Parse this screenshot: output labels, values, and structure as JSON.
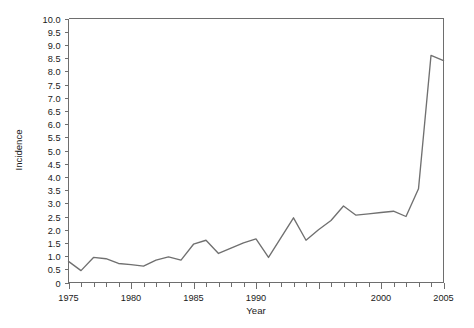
{
  "chart_data": {
    "type": "line",
    "title": "",
    "xlabel": "Year",
    "ylabel": "Incidence",
    "xlim": [
      1975,
      2005
    ],
    "ylim": [
      0,
      10
    ],
    "grid": false,
    "legend": null,
    "x_major_ticks": [
      1975,
      1980,
      1985,
      1990,
      1995,
      2000,
      2005
    ],
    "x_tick_labels": [
      "1975",
      "1980",
      "1985",
      "1990",
      "",
      "2000",
      "2005"
    ],
    "x_minor_tick_step": 1,
    "y_ticks": [
      0,
      0.5,
      1.0,
      1.5,
      2.0,
      2.5,
      3.0,
      3.5,
      4.0,
      4.5,
      5.0,
      5.5,
      6.0,
      6.5,
      7.0,
      7.5,
      8.0,
      8.5,
      9.0,
      9.5,
      10.0
    ],
    "y_tick_labels": [
      "0",
      "0.5",
      "1.0",
      "1.5",
      "2.0",
      "2.5",
      "3.0",
      "3.5",
      "4.0",
      "4.5",
      "5.0",
      "5.5",
      "6.0",
      "6.5",
      "7.0",
      "7.5",
      "8.0",
      "8.5",
      "9.0",
      "9.5",
      "10.0"
    ],
    "line_color": "#707070",
    "axis_color": "#6e6e6e",
    "x": [
      1975,
      1976,
      1977,
      1978,
      1979,
      1980,
      1981,
      1982,
      1983,
      1984,
      1985,
      1986,
      1987,
      1988,
      1989,
      1990,
      1991,
      1992,
      1993,
      1994,
      1995,
      1996,
      1997,
      1998,
      1999,
      2000,
      2001,
      2002,
      2003,
      2004,
      2005
    ],
    "values": [
      0.8,
      0.45,
      0.95,
      0.9,
      0.72,
      0.68,
      0.62,
      0.85,
      0.97,
      0.85,
      1.45,
      1.6,
      1.1,
      1.3,
      1.5,
      1.65,
      0.95,
      1.7,
      2.45,
      1.6,
      2.0,
      2.35,
      2.9,
      2.55,
      2.6,
      2.65,
      2.7,
      2.5,
      3.55,
      8.6,
      8.4
    ],
    "series": [
      {
        "name": "Incidence",
        "values": [
          0.8,
          0.45,
          0.95,
          0.9,
          0.72,
          0.68,
          0.62,
          0.85,
          0.97,
          0.85,
          1.45,
          1.6,
          1.1,
          1.3,
          1.5,
          1.65,
          0.95,
          1.7,
          2.45,
          1.6,
          2.0,
          2.35,
          2.9,
          2.55,
          2.6,
          2.65,
          2.7,
          2.5,
          3.55,
          8.6,
          8.4
        ]
      }
    ]
  }
}
